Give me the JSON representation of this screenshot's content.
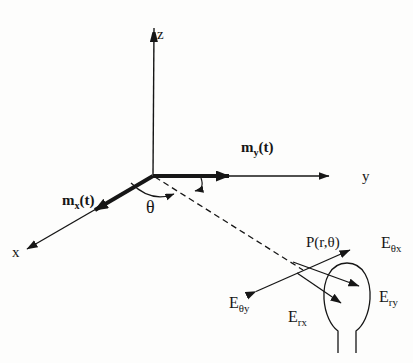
{
  "figure": {
    "background": "#fdfdfc",
    "ink": "#161616",
    "axes": {
      "x_label": "x",
      "y_label": "y",
      "z_label": "z"
    },
    "moments": {
      "mx": {
        "base": "m",
        "sub": "x",
        "arg": "(t)"
      },
      "my": {
        "base": "m",
        "sub": "y",
        "arg": "(t)"
      }
    },
    "angle": {
      "theta_label": "θ"
    },
    "observation_point": {
      "label": "P(r,θ)"
    },
    "fields": {
      "e_theta_x": {
        "base": "E",
        "sub": "θx"
      },
      "e_theta_y": {
        "base": "E",
        "sub": "θy"
      },
      "e_rx": {
        "base": "E",
        "sub": "rx"
      },
      "e_ry": {
        "base": "E",
        "sub": "ry"
      }
    }
  }
}
